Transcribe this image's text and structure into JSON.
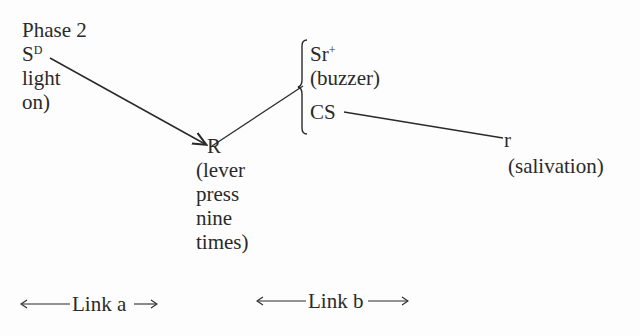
{
  "title": "Phase 2",
  "nodes": {
    "sd": {
      "symbol": "S",
      "sup": "D",
      "lines": [
        "light",
        "on)"
      ]
    },
    "r": {
      "symbol": "R",
      "lines": [
        "(lever",
        "press",
        "nine",
        "times)"
      ]
    },
    "sr": {
      "symbol": "Sr",
      "sup": "+",
      "desc": "(buzzer)",
      "cs": "CS"
    },
    "resp": {
      "symbol": "r",
      "desc": "(salivation)"
    }
  },
  "links": {
    "a": "Link a",
    "b": "Link b"
  },
  "colors": {
    "ink": "#2a2a2a",
    "background": "#fdfdfd"
  }
}
